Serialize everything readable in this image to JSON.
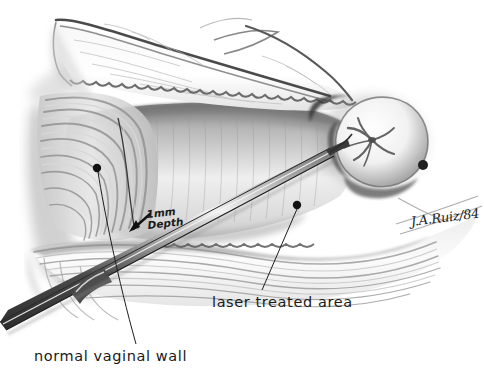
{
  "illustration": {
    "title": "Laser treatment of vaginal wall — surgical illustration",
    "medium": "graphite pencil drawing",
    "background_color": "#ffffff",
    "ink_color": "#1a1a1a"
  },
  "labels": {
    "normal_wall": "normal vaginal wall",
    "laser_area": "laser treated area",
    "depth_line1": "1mm",
    "depth_line2": "Depth",
    "signature": "J.A.Ruiz/84"
  },
  "annotations": [
    {
      "name": "normal-vaginal-wall",
      "text": "normal vaginal wall",
      "dot": [
        97,
        168
      ],
      "leader_end": [
        136,
        344
      ]
    },
    {
      "name": "laser-treated-area",
      "text": "laser treated area",
      "dot": [
        297,
        205
      ],
      "leader_end": [
        262,
        290
      ]
    },
    {
      "name": "depth-callout",
      "text": "1mm Depth",
      "arrow_tip": [
        130,
        231
      ],
      "arrow_tail": [
        152,
        215
      ]
    }
  ],
  "structures": [
    "anterior tissue flap",
    "vaginal rugae",
    "vaginal canal",
    "cervix",
    "cervical os",
    "laser fiber probe",
    "lower vaginal wall folds"
  ]
}
